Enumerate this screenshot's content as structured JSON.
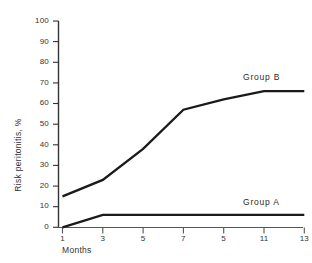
{
  "chart_data": {
    "type": "line",
    "title": "",
    "subtitle": "",
    "xlabel": "Months",
    "ylabel": "Risk peritonitis, %",
    "x": [
      1,
      3,
      5,
      7,
      9,
      11,
      13
    ],
    "xtick_labels": [
      "1",
      "3",
      "5",
      "7",
      "5",
      "11",
      "13"
    ],
    "ytick_labels": [
      "100",
      "90",
      "80",
      "70",
      "60",
      "50",
      "40",
      "30",
      "20",
      "10",
      "0"
    ],
    "ytick_values": [
      100,
      90,
      80,
      70,
      60,
      50,
      40,
      30,
      20,
      10,
      0
    ],
    "xlim": [
      1,
      13
    ],
    "ylim": [
      0,
      100
    ],
    "grid": false,
    "legend_position": "inline-right-of-series",
    "series": [
      {
        "name": "Group B",
        "label": "Group B",
        "color": "#1a1a1a",
        "x": [
          1,
          3,
          5,
          7,
          9,
          11,
          13
        ],
        "values": [
          15,
          23,
          38,
          57,
          62,
          66,
          66
        ]
      },
      {
        "name": "Group A",
        "label": "Group A",
        "color": "#1a1a1a",
        "x": [
          1,
          3,
          5,
          7,
          9,
          11,
          13
        ],
        "values": [
          0,
          6,
          6,
          6,
          6,
          6,
          6
        ]
      }
    ],
    "annotations": [
      {
        "text": "Group B",
        "series": "Group B",
        "at_x": 13
      },
      {
        "text": "Group A",
        "series": "Group A",
        "at_x": 13
      }
    ],
    "axis_color": "#333333",
    "background_color": "#ffffff"
  },
  "axes": {
    "y_title": "Risk peritonitis, %",
    "x_title": "Months",
    "y_ticks": [
      {
        "label": "100"
      },
      {
        "label": "90"
      },
      {
        "label": "80"
      },
      {
        "label": "70"
      },
      {
        "label": "60"
      },
      {
        "label": "50"
      },
      {
        "label": "40"
      },
      {
        "label": "30"
      },
      {
        "label": "20"
      },
      {
        "label": "10"
      },
      {
        "label": "0"
      }
    ],
    "x_ticks": [
      {
        "label": "1"
      },
      {
        "label": "3"
      },
      {
        "label": "5"
      },
      {
        "label": "7"
      },
      {
        "label": "5"
      },
      {
        "label": "11"
      },
      {
        "label": "13"
      }
    ]
  },
  "labels": {
    "group_b": "Group B",
    "group_a": "Group A"
  }
}
